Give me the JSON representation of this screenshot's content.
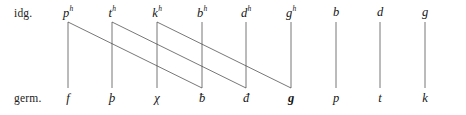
{
  "diagram": {
    "type": "sound-correspondence-chart",
    "width": 466,
    "height": 115,
    "line_color": "#4a4a4a",
    "background_color": "#ffffff",
    "rows": [
      {
        "id": "idg",
        "label": "idg.",
        "label_x": 14,
        "label_y": 7,
        "node_y": 6
      },
      {
        "id": "germ",
        "label": "germ.",
        "label_x": 14,
        "label_y": 92,
        "node_y": 92
      }
    ],
    "columns": [
      {
        "index": 0,
        "x": 68,
        "top_base": "p",
        "top_sup": "h",
        "bottom_base": "f",
        "bottom_sup": "",
        "bottom_bold": false
      },
      {
        "index": 1,
        "x": 112,
        "top_base": "t",
        "top_sup": "h",
        "bottom_base": "þ",
        "bottom_sup": "",
        "bottom_bold": false
      },
      {
        "index": 2,
        "x": 157,
        "top_base": "k",
        "top_sup": "h",
        "bottom_base": "χ",
        "bottom_sup": "",
        "bottom_bold": false
      },
      {
        "index": 3,
        "x": 202,
        "top_base": "b",
        "top_sup": "h",
        "bottom_base": "ƀ",
        "bottom_sup": "",
        "bottom_bold": false
      },
      {
        "index": 4,
        "x": 246,
        "top_base": "d",
        "top_sup": "h",
        "bottom_base": "đ",
        "bottom_sup": "",
        "bottom_bold": false
      },
      {
        "index": 5,
        "x": 291,
        "top_base": "g",
        "top_sup": "h",
        "bottom_base": "g",
        "bottom_sup": "",
        "bottom_bold": true
      },
      {
        "index": 6,
        "x": 336,
        "top_base": "b",
        "top_sup": "",
        "bottom_base": "p",
        "bottom_sup": "",
        "bottom_bold": false
      },
      {
        "index": 7,
        "x": 380,
        "top_base": "d",
        "top_sup": "",
        "bottom_base": "t",
        "bottom_sup": "",
        "bottom_bold": false
      },
      {
        "index": 8,
        "x": 425,
        "top_base": "g",
        "top_sup": "",
        "bottom_base": "k",
        "bottom_sup": "",
        "bottom_bold": false
      }
    ],
    "vertical_lines": [
      {
        "from_column": 0,
        "y1": 22,
        "y2": 88
      },
      {
        "from_column": 1,
        "y1": 22,
        "y2": 88
      },
      {
        "from_column": 2,
        "y1": 22,
        "y2": 88
      },
      {
        "from_column": 3,
        "y1": 22,
        "y2": 88
      },
      {
        "from_column": 4,
        "y1": 22,
        "y2": 88
      },
      {
        "from_column": 5,
        "y1": 22,
        "y2": 88
      },
      {
        "from_column": 6,
        "y1": 22,
        "y2": 88
      },
      {
        "from_column": 7,
        "y1": 22,
        "y2": 88
      },
      {
        "from_column": 8,
        "y1": 22,
        "y2": 88
      }
    ],
    "diagonal_lines": [
      {
        "from_column": 0,
        "to_column": 3,
        "y1": 22,
        "y2": 88
      },
      {
        "from_column": 1,
        "to_column": 4,
        "y1": 22,
        "y2": 88
      },
      {
        "from_column": 2,
        "to_column": 5,
        "y1": 22,
        "y2": 88
      }
    ]
  }
}
